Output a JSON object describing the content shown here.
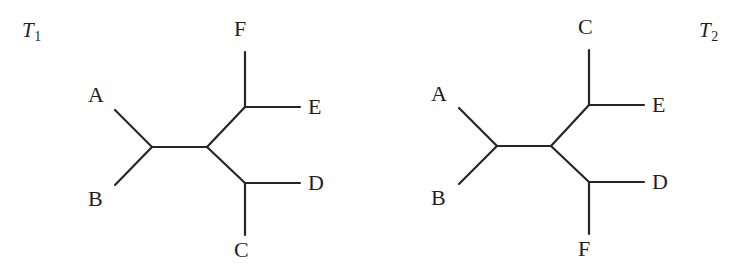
{
  "figure": {
    "background_color": "#ffffff",
    "stroke_color": "#262626",
    "text_color": "#1f1f1f",
    "width": 748,
    "height": 278
  },
  "trees": [
    {
      "id": "T1",
      "caption_base": "T",
      "caption_sub": "1",
      "caption_pos": {
        "x": 22,
        "y": 20
      },
      "center_node": {
        "x": 207,
        "y": 147
      },
      "left_node": {
        "x": 152,
        "y": 147
      },
      "upper_node": {
        "x": 245,
        "y": 107
      },
      "lower_node": {
        "x": 245,
        "y": 183
      },
      "leaves": [
        {
          "name": "A",
          "label": "A",
          "tip": {
            "x": 115,
            "y": 110
          },
          "label_pos": {
            "x": 88,
            "y": 84
          }
        },
        {
          "name": "B",
          "label": "B",
          "tip": {
            "x": 115,
            "y": 185
          },
          "label_pos": {
            "x": 88,
            "y": 188
          }
        },
        {
          "name": "F",
          "label": "F",
          "tip": {
            "x": 245,
            "y": 52
          },
          "label_pos": {
            "x": 234,
            "y": 18
          }
        },
        {
          "name": "E",
          "label": "E",
          "tip": {
            "x": 300,
            "y": 107
          },
          "label_pos": {
            "x": 308,
            "y": 96
          }
        },
        {
          "name": "D",
          "label": "D",
          "tip": {
            "x": 300,
            "y": 183
          },
          "label_pos": {
            "x": 308,
            "y": 172
          }
        },
        {
          "name": "C",
          "label": "C",
          "tip": {
            "x": 245,
            "y": 235
          },
          "label_pos": {
            "x": 234,
            "y": 239
          }
        }
      ]
    },
    {
      "id": "T2",
      "caption_base": "T",
      "caption_sub": "2",
      "caption_pos": {
        "x": 699,
        "y": 20
      },
      "center_node": {
        "x": 551,
        "y": 146
      },
      "left_node": {
        "x": 497,
        "y": 146
      },
      "upper_node": {
        "x": 589,
        "y": 105
      },
      "lower_node": {
        "x": 589,
        "y": 182
      },
      "leaves": [
        {
          "name": "A",
          "label": "A",
          "tip": {
            "x": 459,
            "y": 108
          },
          "label_pos": {
            "x": 431,
            "y": 83
          }
        },
        {
          "name": "B",
          "label": "B",
          "tip": {
            "x": 459,
            "y": 184
          },
          "label_pos": {
            "x": 431,
            "y": 187
          }
        },
        {
          "name": "C",
          "label": "C",
          "tip": {
            "x": 589,
            "y": 50
          },
          "label_pos": {
            "x": 578,
            "y": 16
          }
        },
        {
          "name": "E",
          "label": "E",
          "tip": {
            "x": 644,
            "y": 105
          },
          "label_pos": {
            "x": 652,
            "y": 94
          }
        },
        {
          "name": "D",
          "label": "D",
          "tip": {
            "x": 644,
            "y": 182
          },
          "label_pos": {
            "x": 652,
            "y": 171
          }
        },
        {
          "name": "F",
          "label": "F",
          "tip": {
            "x": 589,
            "y": 234
          },
          "label_pos": {
            "x": 578,
            "y": 238
          }
        }
      ]
    }
  ]
}
